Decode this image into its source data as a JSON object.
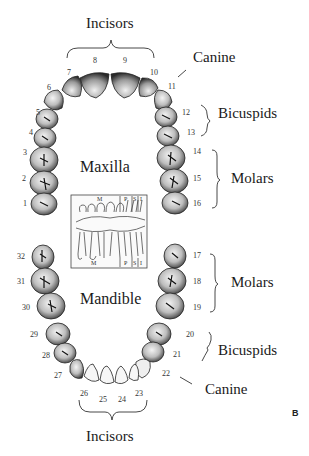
{
  "figure": {
    "panel_label": "B",
    "regions": {
      "upper": "Maxilla",
      "lower": "Mandible"
    },
    "groups": {
      "top_incisors": "Incisors",
      "upper_canine": "Canine",
      "upper_bicuspids": "Bicuspids",
      "upper_molars": "Molars",
      "lower_molars": "Molars",
      "lower_bicuspids": "Bicuspids",
      "lower_canine": "Canine",
      "bottom_incisors": "Incisors"
    },
    "tooth_numbers": {
      "t1": "1",
      "t2": "2",
      "t3": "3",
      "t4": "4",
      "t5": "5",
      "t6": "6",
      "t7": "7",
      "t8": "8",
      "t9": "9",
      "t10": "10",
      "t11": "11",
      "t12": "12",
      "t13": "13",
      "t14": "14",
      "t15": "15",
      "t16": "16",
      "t17": "17",
      "t18": "18",
      "t19": "19",
      "t20": "20",
      "t21": "21",
      "t22": "22",
      "t23": "23",
      "t24": "24",
      "t25": "25",
      "t26": "26",
      "t27": "27",
      "t28": "28",
      "t29": "29",
      "t30": "30",
      "t31": "31",
      "t32": "32"
    },
    "inset": {
      "top_labels": [
        "M",
        "P",
        "S",
        "I"
      ],
      "bottom_labels": [
        "M",
        "P",
        "S",
        "I"
      ]
    }
  }
}
